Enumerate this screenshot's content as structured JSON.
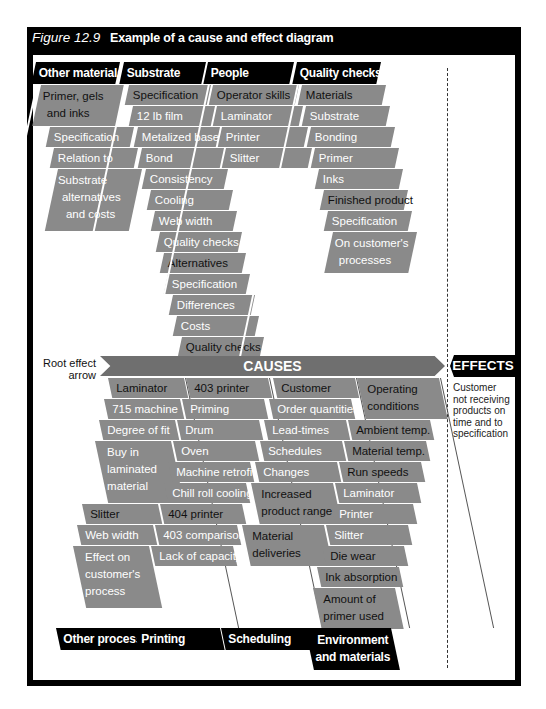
{
  "figure": {
    "number": "Figure 12.9",
    "caption": "Example of a cause and effect diagram"
  },
  "spine": {
    "causes_label": "CAUSES",
    "effects_label": "EFFECTS",
    "root_label_line1": "Root effect",
    "root_label_line2": "arrow",
    "effect_text": [
      "Customer",
      "not receiving",
      "products on",
      "time and to",
      "specification"
    ]
  },
  "top_categories": [
    {
      "header": "Other materials",
      "items": [
        {
          "label": "Primer, gels",
          "label2": "and inks",
          "dark": true
        },
        {
          "label": "Specification"
        },
        {
          "label": "Relation to"
        },
        {
          "label": "Substrate",
          "label2": "alternatives",
          "label3": "and costs"
        }
      ]
    },
    {
      "header": "Substrate",
      "items": [
        {
          "label": "Specification",
          "dark": true
        },
        {
          "label": "12 lb film"
        },
        {
          "label": "Metalized base"
        },
        {
          "label": "Bond"
        },
        {
          "label": "Consistency"
        },
        {
          "label": "Cooling"
        },
        {
          "label": "Web width"
        },
        {
          "label": "Quality checks"
        },
        {
          "label": "Alternatives",
          "dark": true
        },
        {
          "label": "Specification"
        },
        {
          "label": "Differences"
        },
        {
          "label": "Costs"
        },
        {
          "label": "Quality checks",
          "dark": true
        }
      ]
    },
    {
      "header": "People",
      "items": [
        {
          "label": "Operator skills",
          "dark": true
        },
        {
          "label": "Laminator"
        },
        {
          "label": "Printer"
        },
        {
          "label": "Slitter"
        }
      ]
    },
    {
      "header": "Quality checks",
      "items": [
        {
          "label": "Materials",
          "dark": true
        },
        {
          "label": "Substrate"
        },
        {
          "label": "Bonding"
        },
        {
          "label": "Primer"
        },
        {
          "label": "Inks"
        },
        {
          "label": "Finished product",
          "dark": true
        },
        {
          "label": "Specification"
        },
        {
          "label": "On customer's",
          "label2": "processes"
        }
      ]
    }
  ],
  "bottom_categories": [
    {
      "header": "Other processes",
      "items": [
        {
          "label": "Laminator",
          "dark": true
        },
        {
          "label": "715 machine"
        },
        {
          "label": "Degree of fit"
        },
        {
          "label": "Buy in",
          "label2": "laminated",
          "label3": "material"
        },
        {
          "label": "Slitter",
          "dark": true
        },
        {
          "label": "Web width"
        },
        {
          "label": "Effect on",
          "label2": "customer's",
          "label3": "process"
        }
      ]
    },
    {
      "header": "Printing",
      "items": [
        {
          "label": "403 printer",
          "dark": true
        },
        {
          "label": "Priming"
        },
        {
          "label": "Drum"
        },
        {
          "label": "Oven"
        },
        {
          "label": "Machine retrofit"
        },
        {
          "label": "Chill roll cooling"
        },
        {
          "label": "404 printer",
          "dark": true
        },
        {
          "label": "403 comparison"
        },
        {
          "label": "Lack of capacity"
        }
      ]
    },
    {
      "header": "Scheduling",
      "items": [
        {
          "label": "Customer",
          "dark": true
        },
        {
          "label": "Order quantities"
        },
        {
          "label": "Lead-times"
        },
        {
          "label": "Schedules"
        },
        {
          "label": "Changes"
        },
        {
          "label": "Increased",
          "label2": "product range",
          "dark": true
        },
        {
          "label": "Material",
          "label2": "deliveries",
          "dark": true
        }
      ]
    },
    {
      "header": "Environment",
      "header2": "and materials",
      "items": [
        {
          "label": "Operating",
          "label2": "conditions",
          "dark": true
        },
        {
          "label": "Ambient temp.",
          "dark": true
        },
        {
          "label": "Material temp.",
          "dark": true
        },
        {
          "label": "Run speeds",
          "dark": true
        },
        {
          "label": "Laminator"
        },
        {
          "label": "Printer"
        },
        {
          "label": "Slitter"
        },
        {
          "label": "Die wear",
          "dark": true
        },
        {
          "label": "Ink absorption",
          "dark": true
        },
        {
          "label": "Amount of",
          "label2": "primer used",
          "dark": true
        }
      ]
    }
  ],
  "colors": {
    "frame": "#000000",
    "cell_fill": "#8a8a8a",
    "spine_fill": "#6f6f6f",
    "header_fill": "#000000",
    "background": "#ffffff"
  }
}
